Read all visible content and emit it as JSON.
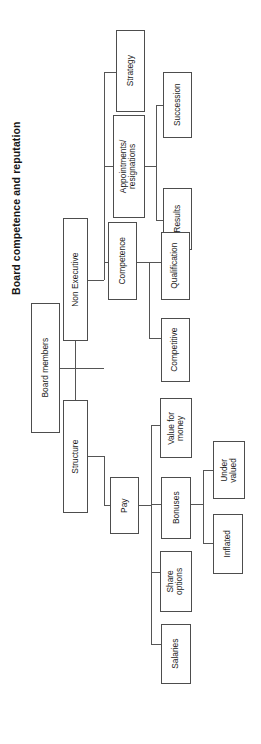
{
  "title": "Board competence and reputation",
  "diagram": {
    "type": "tree",
    "orientation": "rotated-90-ccw",
    "root": "Board members",
    "nodes": [
      {
        "id": "board-members",
        "label": "Board members",
        "level": 0
      },
      {
        "id": "non-executive",
        "label": "Non Executive",
        "level": 1,
        "parent": "board-members"
      },
      {
        "id": "structure",
        "label": "Structure",
        "level": 1,
        "parent": "board-members"
      },
      {
        "id": "strategy",
        "label": "Strategy",
        "level": 2,
        "parent": "non-executive"
      },
      {
        "id": "appointments-resignations",
        "label": "Appointments/\nresignations",
        "level": 2,
        "parent": "non-executive"
      },
      {
        "id": "competence",
        "label": "Competence",
        "level": 2,
        "parent": "non-executive"
      },
      {
        "id": "succession",
        "label": "Succession",
        "level": 3,
        "parent": "appointments-resignations"
      },
      {
        "id": "results",
        "label": "Results",
        "level": 3,
        "parent": "appointments-resignations"
      },
      {
        "id": "qualification",
        "label": "Qualification",
        "level": 3,
        "parent": "competence"
      },
      {
        "id": "competitive",
        "label": "Competitive",
        "level": 3,
        "parent": "competence"
      },
      {
        "id": "pay",
        "label": "Pay",
        "level": 2,
        "parent": "structure"
      },
      {
        "id": "value-for-money",
        "label": "Value for\nmoney",
        "level": 3,
        "parent": "pay"
      },
      {
        "id": "bonuses",
        "label": "Bonuses",
        "level": 3,
        "parent": "pay"
      },
      {
        "id": "share-options",
        "label": "Share\noptions",
        "level": 3,
        "parent": "pay"
      },
      {
        "id": "salaries",
        "label": "Salaries",
        "level": 3,
        "parent": "pay"
      },
      {
        "id": "under-valued",
        "label": "Under\nvalued",
        "level": 4,
        "parent": "bonuses"
      },
      {
        "id": "inflated",
        "label": "Inflated",
        "level": 4,
        "parent": "bonuses"
      }
    ],
    "colors": {
      "box_border": "#4d4d4d",
      "line": "#555555",
      "text": "#1a1a1a",
      "background": "#ffffff"
    }
  }
}
